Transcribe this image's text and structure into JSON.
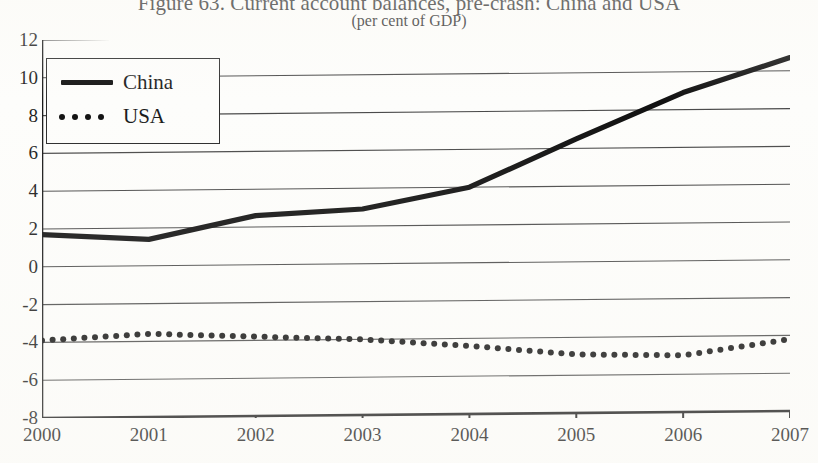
{
  "figure": {
    "title": "Figure 63. Current account balances, pre-crash: China and USA",
    "subtitle": "(per cent of GDP)"
  },
  "legend": {
    "position": "top-left",
    "entries": [
      {
        "label": "China",
        "style": "solid",
        "key_icon": "solid-line-icon"
      },
      {
        "label": "USA",
        "style": "dotted",
        "key_icon": "dotted-line-icon"
      }
    ]
  },
  "axes": {
    "y_ticks": [
      "12",
      "10",
      "8",
      "6",
      "4",
      "2",
      "0",
      "-2",
      "-4",
      "-6",
      "-8"
    ],
    "x_ticks": [
      "2000",
      "2001",
      "2002",
      "2003",
      "2004",
      "2005",
      "2006",
      "2007"
    ]
  },
  "colors": {
    "ink": "#111111",
    "gridline": "#4a4a4a",
    "axis": "#1a1a1a",
    "paper": "#fdfdfb"
  },
  "chart_data": {
    "type": "line",
    "title": "Figure 63. Current account balances, pre-crash: China and USA",
    "subtitle": "(per cent of GDP)",
    "xlabel": "",
    "ylabel": "",
    "x": [
      2000,
      2001,
      2002,
      2003,
      2004,
      2005,
      2006,
      2007
    ],
    "categories": [
      "2000",
      "2001",
      "2002",
      "2003",
      "2004",
      "2005",
      "2006",
      "2007"
    ],
    "series": [
      {
        "name": "China",
        "style": "solid",
        "values": [
          1.7,
          1.4,
          2.6,
          2.9,
          4.0,
          6.5,
          8.9,
          10.7
        ]
      },
      {
        "name": "USA",
        "style": "dotted",
        "values": [
          -3.9,
          -3.6,
          -3.8,
          -4.0,
          -4.4,
          -4.9,
          -5.0,
          -4.2
        ]
      }
    ],
    "ylim": [
      -8,
      12
    ],
    "xlim": [
      2000,
      2007
    ],
    "ytick_step": 2,
    "grid": "horizontal",
    "legend": "top-left"
  }
}
